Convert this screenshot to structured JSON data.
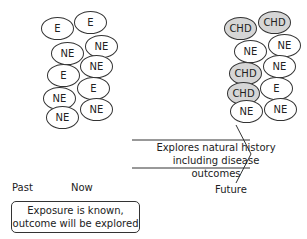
{
  "now_group": {
    "ovals": [
      {
        "label": "E",
        "x": 41,
        "y": 17,
        "type": "exposed"
      },
      {
        "label": "E",
        "x": 74,
        "y": 11,
        "type": "exposed"
      },
      {
        "label": "NE",
        "x": 51,
        "y": 42,
        "type": "not-exposed"
      },
      {
        "label": "NE",
        "x": 85,
        "y": 35,
        "type": "not-exposed"
      },
      {
        "label": "E",
        "x": 47,
        "y": 64,
        "type": "exposed"
      },
      {
        "label": "NE",
        "x": 80,
        "y": 55,
        "type": "not-exposed"
      },
      {
        "label": "NE",
        "x": 43,
        "y": 87,
        "type": "not-exposed"
      },
      {
        "label": "E",
        "x": 77,
        "y": 77,
        "type": "exposed"
      },
      {
        "label": "NE",
        "x": 46,
        "y": 106,
        "type": "not-exposed"
      },
      {
        "label": "NE",
        "x": 80,
        "y": 98,
        "type": "not-exposed"
      }
    ]
  },
  "future_group": {
    "ovals": [
      {
        "label": "CHD",
        "x": 224,
        "y": 17,
        "type": "chd"
      },
      {
        "label": "CHD",
        "x": 258,
        "y": 11,
        "type": "chd"
      },
      {
        "label": "NE",
        "x": 234,
        "y": 40,
        "type": "not-exposed"
      },
      {
        "label": "NE",
        "x": 268,
        "y": 34,
        "type": "not-exposed"
      },
      {
        "label": "CHD",
        "x": 229,
        "y": 62,
        "type": "chd"
      },
      {
        "label": "NE",
        "x": 263,
        "y": 55,
        "type": "not-exposed"
      },
      {
        "label": "CHD",
        "x": 227,
        "y": 82,
        "type": "chd"
      },
      {
        "label": "E",
        "x": 260,
        "y": 77,
        "type": "exposed"
      },
      {
        "label": "NE",
        "x": 230,
        "y": 100,
        "type": "not-exposed"
      },
      {
        "label": "NE",
        "x": 264,
        "y": 98,
        "type": "not-exposed"
      }
    ]
  },
  "arrow": {
    "line1": "Explores natural history",
    "line2": "including disease outcomes"
  },
  "timeline": {
    "past": "Past",
    "now": "Now",
    "future": "Future"
  },
  "note_box": {
    "line1": "Exposure is known,",
    "line2": "outcome will be explored"
  },
  "colors": {
    "chd_fill": "#d6d6d6",
    "stroke": "#333333"
  }
}
